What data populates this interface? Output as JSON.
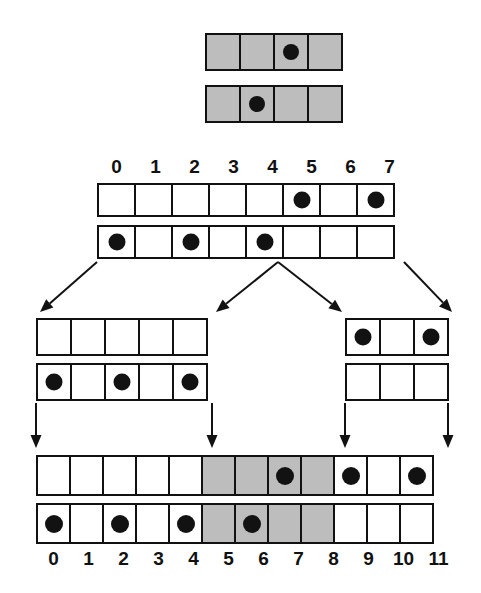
{
  "diagram": {
    "colors": {
      "ink": "#121212",
      "shaded": "#bdbdbd",
      "background": "#ffffff"
    },
    "groups": [
      {
        "id": "top-group",
        "name": "top-node-pair",
        "cell_count": 4,
        "labels": [],
        "rows": [
          {
            "id": "top-row-1",
            "dots": [
              2
            ],
            "shaded": [
              0,
              1,
              2,
              3
            ]
          },
          {
            "id": "top-row-2",
            "dots": [
              1
            ],
            "shaded": [
              0,
              1,
              2,
              3
            ]
          }
        ]
      },
      {
        "id": "parent-group",
        "name": "parent-node-pair",
        "cell_count": 8,
        "labels": [
          "0",
          "1",
          "2",
          "3",
          "4",
          "5",
          "6",
          "7"
        ],
        "labels_position": "above",
        "rows": [
          {
            "id": "parent-row-1",
            "dots": [
              5,
              7
            ],
            "shaded": []
          },
          {
            "id": "parent-row-2",
            "dots": [
              0,
              2,
              4
            ],
            "shaded": []
          }
        ]
      },
      {
        "id": "middle-left-group",
        "name": "middle-left-node-pair",
        "cell_count": 5,
        "labels": [],
        "rows": [
          {
            "id": "middle-left-row-1",
            "dots": [],
            "shaded": []
          },
          {
            "id": "middle-left-row-2",
            "dots": [
              0,
              2,
              4
            ],
            "shaded": []
          }
        ]
      },
      {
        "id": "middle-right-group",
        "name": "middle-right-node-pair",
        "cell_count": 3,
        "labels": [],
        "rows": [
          {
            "id": "middle-right-row-1",
            "dots": [
              0,
              2
            ],
            "shaded": []
          },
          {
            "id": "middle-right-row-2",
            "dots": [],
            "shaded": []
          }
        ]
      },
      {
        "id": "bottom-group",
        "name": "bottom-node-pair",
        "cell_count": 12,
        "labels": [
          "0",
          "1",
          "2",
          "3",
          "4",
          "5",
          "6",
          "7",
          "8",
          "9",
          "10",
          "11"
        ],
        "labels_position": "below",
        "rows": [
          {
            "id": "bottom-row-1",
            "dots": [
              7,
              9,
              11
            ],
            "shaded": [
              5,
              6,
              7,
              8
            ]
          },
          {
            "id": "bottom-row-2",
            "dots": [
              0,
              2,
              4,
              6
            ],
            "shaded": [
              5,
              6,
              7,
              8
            ]
          }
        ]
      }
    ],
    "arrows": [
      {
        "id": "arrow-parent-to-middle-left",
        "name": "arrow-diagonal-left",
        "from": [
          97,
          262
        ],
        "to": [
          40,
          312
        ]
      },
      {
        "id": "arrow-parent-to-middle-mid",
        "name": "arrow-diagonal-center-left",
        "from": [
          278,
          262
        ],
        "to": [
          216,
          312
        ]
      },
      {
        "id": "arrow-parent-to-middle-right",
        "name": "arrow-diagonal-center-right",
        "from": [
          278,
          262
        ],
        "to": [
          342,
          312
        ]
      },
      {
        "id": "arrow-parent-to-far-right",
        "name": "arrow-diagonal-right",
        "from": [
          404,
          262
        ],
        "to": [
          452,
          312
        ]
      },
      {
        "id": "arrow-middle-left-down-left",
        "name": "arrow-vertical-left",
        "from": [
          36,
          403
        ],
        "to": [
          36,
          448
        ]
      },
      {
        "id": "arrow-middle-left-down-right",
        "name": "arrow-vertical-center-left",
        "from": [
          212,
          403
        ],
        "to": [
          212,
          448
        ]
      },
      {
        "id": "arrow-middle-right-down-left",
        "name": "arrow-vertical-center-right",
        "from": [
          345,
          403
        ],
        "to": [
          345,
          448
        ]
      },
      {
        "id": "arrow-middle-right-down-right",
        "name": "arrow-vertical-right",
        "from": [
          448,
          403
        ],
        "to": [
          448,
          448
        ]
      }
    ]
  }
}
